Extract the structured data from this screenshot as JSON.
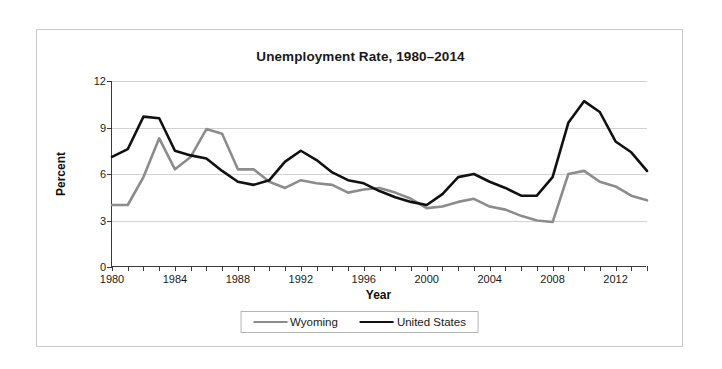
{
  "chart_data": {
    "type": "line",
    "title": "Unemployment Rate, 1980–2014",
    "xlabel": "Year",
    "ylabel": "Percent",
    "ylim": [
      0,
      12
    ],
    "xlim": [
      1980,
      2014
    ],
    "yticks": [
      0,
      3,
      6,
      9,
      12
    ],
    "xticks": [
      1980,
      1984,
      1988,
      1992,
      1996,
      2000,
      2004,
      2008,
      2012
    ],
    "xtick_labels": [
      "1980",
      "1984",
      "1988",
      "1992",
      "1996",
      "2000",
      "2004",
      "2008",
      "2012"
    ],
    "ytick_labels": [
      "0",
      "3",
      "6",
      "9",
      "12"
    ],
    "grid": "horizontal",
    "legend_position": "bottom",
    "x": [
      1980,
      1981,
      1982,
      1983,
      1984,
      1985,
      1986,
      1987,
      1988,
      1989,
      1990,
      1991,
      1992,
      1993,
      1994,
      1995,
      1996,
      1997,
      1998,
      1999,
      2000,
      2001,
      2002,
      2003,
      2004,
      2005,
      2006,
      2007,
      2008,
      2009,
      2010,
      2011,
      2012,
      2013,
      2014
    ],
    "series": [
      {
        "name": "Wyoming",
        "color": "#8c8c8c",
        "values": [
          4.0,
          4.0,
          5.8,
          8.3,
          6.3,
          7.1,
          8.9,
          8.6,
          6.3,
          6.3,
          5.5,
          5.1,
          5.6,
          5.4,
          5.3,
          4.8,
          5.0,
          5.1,
          4.8,
          4.4,
          3.8,
          3.9,
          4.2,
          4.4,
          3.9,
          3.7,
          3.3,
          3.0,
          2.9,
          6.0,
          6.2,
          5.5,
          5.2,
          4.6,
          4.3
        ]
      },
      {
        "name": "United States",
        "color": "#111111",
        "values": [
          7.1,
          7.6,
          9.7,
          9.6,
          7.5,
          7.2,
          7.0,
          6.2,
          5.5,
          5.3,
          5.6,
          6.8,
          7.5,
          6.9,
          6.1,
          5.6,
          5.4,
          4.9,
          4.5,
          4.2,
          4.0,
          4.7,
          5.8,
          6.0,
          5.5,
          5.1,
          4.6,
          4.6,
          5.8,
          9.3,
          10.7,
          10.0,
          8.1,
          7.4,
          6.2
        ]
      }
    ]
  },
  "legend": {
    "items": [
      {
        "label": "Wyoming",
        "color": "#8c8c8c"
      },
      {
        "label": "United States",
        "color": "#111111"
      }
    ]
  }
}
